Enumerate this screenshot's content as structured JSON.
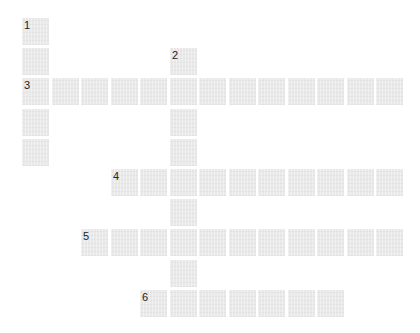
{
  "puzzle": {
    "type": "crossword",
    "cell_color": "#e9e9e9",
    "number_color": "#222222",
    "origin": {
      "x": 22,
      "y": 18
    },
    "pitch": {
      "x": 29.5,
      "y": 30.2
    },
    "cell_size": 27,
    "entries": [
      {
        "number": "1",
        "direction": "down",
        "row": 0,
        "col": 0,
        "length": 5
      },
      {
        "number": "2",
        "direction": "down",
        "row": 1,
        "col": 5,
        "length": 9
      },
      {
        "number": "3",
        "direction": "across",
        "row": 2,
        "col": 0,
        "length": 13
      },
      {
        "number": "4",
        "direction": "across",
        "row": 5,
        "col": 3,
        "length": 10
      },
      {
        "number": "5",
        "direction": "across",
        "row": 7,
        "col": 2,
        "length": 11
      },
      {
        "number": "6",
        "direction": "across",
        "row": 9,
        "col": 4,
        "length": 7
      }
    ]
  }
}
